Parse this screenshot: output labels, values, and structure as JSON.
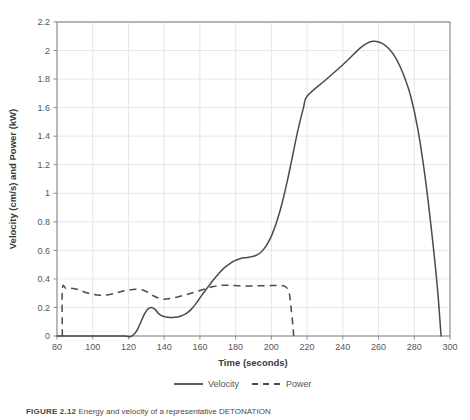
{
  "chart_data": {
    "type": "line",
    "title": "",
    "xlabel": "Time (seconds)",
    "ylabel": "Velocity (cm/s) and Power (kW)",
    "xlim": [
      80,
      300
    ],
    "ylim": [
      0,
      2.2
    ],
    "xticks": [
      80,
      100,
      120,
      140,
      160,
      180,
      200,
      220,
      240,
      260,
      280,
      300
    ],
    "yticks": [
      0,
      0.2,
      0.4,
      0.6,
      0.8,
      1,
      1.2,
      1.4,
      1.6,
      1.8,
      2,
      2.2
    ],
    "xtick_labels": [
      "80",
      "100",
      "120",
      "140",
      "160",
      "180",
      "200",
      "220",
      "240",
      "260",
      "280",
      "300"
    ],
    "ytick_labels": [
      "0",
      "0.2",
      "0.4",
      "0.6",
      "0.8",
      "1",
      "1.2",
      "1.4",
      "1.6",
      "1.8",
      "2",
      "2.2"
    ],
    "grid": true,
    "legend_position": "bottom",
    "series": [
      {
        "name": "Velocity",
        "style": "solid",
        "color": "#4b4b4b",
        "points": [
          [
            80,
            0
          ],
          [
            100,
            0
          ],
          [
            110,
            0
          ],
          [
            118,
            0
          ],
          [
            121,
            -0.005
          ],
          [
            123,
            0.01
          ],
          [
            125,
            0.045
          ],
          [
            127,
            0.1
          ],
          [
            129,
            0.155
          ],
          [
            131,
            0.19
          ],
          [
            133,
            0.2
          ],
          [
            135,
            0.185
          ],
          [
            137,
            0.155
          ],
          [
            139,
            0.14
          ],
          [
            142,
            0.132
          ],
          [
            146,
            0.131
          ],
          [
            149,
            0.138
          ],
          [
            152,
            0.155
          ],
          [
            155,
            0.185
          ],
          [
            158,
            0.23
          ],
          [
            161,
            0.285
          ],
          [
            164,
            0.335
          ],
          [
            167,
            0.385
          ],
          [
            170,
            0.43
          ],
          [
            173,
            0.47
          ],
          [
            176,
            0.5
          ],
          [
            179,
            0.525
          ],
          [
            182,
            0.54
          ],
          [
            185,
            0.548
          ],
          [
            188,
            0.553
          ],
          [
            191,
            0.562
          ],
          [
            194,
            0.585
          ],
          [
            197,
            0.63
          ],
          [
            200,
            0.7
          ],
          [
            203,
            0.8
          ],
          [
            206,
            0.93
          ],
          [
            209,
            1.09
          ],
          [
            212,
            1.27
          ],
          [
            215,
            1.45
          ],
          [
            218,
            1.6
          ],
          [
            220,
            1.68
          ],
          [
            230,
            1.79
          ],
          [
            240,
            1.9
          ],
          [
            250,
            2.02
          ],
          [
            255,
            2.06
          ],
          [
            258,
            2.065
          ],
          [
            262,
            2.05
          ],
          [
            266,
            2.01
          ],
          [
            270,
            1.94
          ],
          [
            274,
            1.83
          ],
          [
            278,
            1.68
          ],
          [
            282,
            1.45
          ],
          [
            286,
            1.12
          ],
          [
            290,
            0.7
          ],
          [
            293,
            0.33
          ],
          [
            295,
            0.0
          ]
        ]
      },
      {
        "name": "Power",
        "style": "dashed",
        "color": "#4b4b4b",
        "points": [
          [
            83,
            0
          ],
          [
            83,
            0.33
          ],
          [
            85,
            0.335
          ],
          [
            88,
            0.335
          ],
          [
            92,
            0.325
          ],
          [
            96,
            0.305
          ],
          [
            100,
            0.292
          ],
          [
            104,
            0.285
          ],
          [
            108,
            0.288
          ],
          [
            112,
            0.298
          ],
          [
            116,
            0.312
          ],
          [
            120,
            0.322
          ],
          [
            124,
            0.327
          ],
          [
            128,
            0.322
          ],
          [
            131,
            0.305
          ],
          [
            134,
            0.282
          ],
          [
            137,
            0.265
          ],
          [
            140,
            0.258
          ],
          [
            143,
            0.262
          ],
          [
            147,
            0.272
          ],
          [
            151,
            0.285
          ],
          [
            155,
            0.3
          ],
          [
            159,
            0.315
          ],
          [
            163,
            0.33
          ],
          [
            167,
            0.345
          ],
          [
            172,
            0.355
          ],
          [
            177,
            0.355
          ],
          [
            182,
            0.352
          ],
          [
            188,
            0.35
          ],
          [
            194,
            0.352
          ],
          [
            200,
            0.353
          ],
          [
            205,
            0.352
          ],
          [
            208,
            0.345
          ],
          [
            210,
            0.3
          ],
          [
            211,
            0.2
          ],
          [
            212,
            0.08
          ],
          [
            212.5,
            0
          ]
        ]
      }
    ],
    "legend": [
      {
        "label": "Velocity",
        "style": "solid"
      },
      {
        "label": "Power",
        "style": "dashed"
      }
    ],
    "annotations": {
      "velocity_peak_value": "2.06",
      "velocity_peak_time": "256",
      "power_plateau_value": "0.35",
      "power_start_time": "83",
      "power_end_time": "212",
      "velocity_onset_time": "122",
      "velocity_end_time": "295"
    }
  },
  "caption": {
    "figure_number": "FIGURE 2.12",
    "text": "Energy and velocity of a representative DETONATION"
  }
}
